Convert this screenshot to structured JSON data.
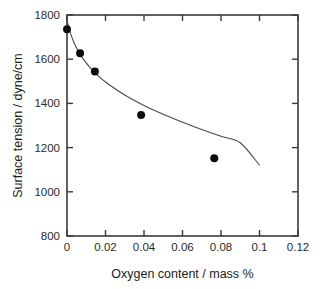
{
  "chart_data": {
    "type": "scatter",
    "title": "",
    "xlabel": "Oxygen content / mass %",
    "ylabel": "Surface tension / dyne/cm",
    "xlim": [
      0,
      0.12
    ],
    "ylim": [
      800,
      1800
    ],
    "grid": false,
    "legend": false,
    "xticks": [
      "0",
      "0.02",
      "0.04",
      "0.06",
      "0.08",
      "0.1",
      "0.12"
    ],
    "xtick_values": [
      0,
      0.02,
      0.04,
      0.06,
      0.08,
      0.1,
      0.12
    ],
    "yticks": [
      "800",
      "1000",
      "1200",
      "1400",
      "1600",
      "1800"
    ],
    "ytick_values": [
      800,
      1000,
      1200,
      1400,
      1600,
      1800
    ],
    "series": [
      {
        "name": "measured points",
        "marker": "filled-circle",
        "color": "#0b0b0b",
        "x": [
          0.0,
          0.0068,
          0.0145,
          0.0385,
          0.0765
        ],
        "y": [
          1736,
          1627,
          1544,
          1348,
          1152
        ]
      },
      {
        "name": "fitted curve",
        "marker": "line",
        "color": "#4a4a4a",
        "x": [
          0.0,
          0.002,
          0.004,
          0.006,
          0.008,
          0.012,
          0.016,
          0.02,
          0.03,
          0.04,
          0.05,
          0.06,
          0.07,
          0.08,
          0.09,
          0.1
        ],
        "y": [
          1775,
          1712,
          1668,
          1634,
          1606,
          1562,
          1527,
          1497,
          1438,
          1391,
          1351,
          1315,
          1282,
          1251,
          1222,
          1120
        ]
      }
    ]
  },
  "axis_colors": {
    "frame": "#3a3a3a",
    "tick": "#3a3a3a",
    "text": "#2b2b2b",
    "point": "#0b0b0b",
    "curve": "#4a4a4a"
  }
}
